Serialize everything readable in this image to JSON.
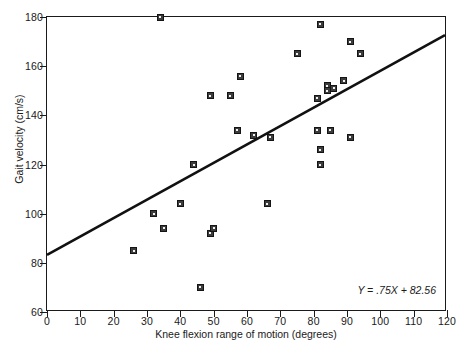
{
  "chart_data": {
    "type": "scatter",
    "title": "",
    "xlabel": "Knee flexion range of motion (degrees)",
    "ylabel": "Gait velocity (cm/s)",
    "xlim": [
      0,
      120
    ],
    "ylim": [
      60,
      180
    ],
    "xticks": [
      0,
      10,
      20,
      30,
      40,
      50,
      60,
      70,
      80,
      90,
      100,
      110,
      120
    ],
    "yticks": [
      60,
      80,
      100,
      120,
      140,
      160,
      180
    ],
    "grid": false,
    "legend": null,
    "annotations": [
      {
        "name": "regression-equation",
        "text": "Y = .75X + 82.56",
        "position": "bottom-right"
      }
    ],
    "fit_line": {
      "type": "linear",
      "slope": 0.75,
      "intercept": 82.56,
      "equation": "Y = .75X + 82.56",
      "x_start": 0,
      "y_start": 82.56,
      "x_end": 120,
      "y_end": 172.56
    },
    "points": [
      {
        "x": 26,
        "y": 85
      },
      {
        "x": 32,
        "y": 100
      },
      {
        "x": 34,
        "y": 180
      },
      {
        "x": 35,
        "y": 94
      },
      {
        "x": 40,
        "y": 104
      },
      {
        "x": 44,
        "y": 120
      },
      {
        "x": 46,
        "y": 70
      },
      {
        "x": 49,
        "y": 92
      },
      {
        "x": 49,
        "y": 148
      },
      {
        "x": 50,
        "y": 94
      },
      {
        "x": 55,
        "y": 148
      },
      {
        "x": 57,
        "y": 134
      },
      {
        "x": 58,
        "y": 156
      },
      {
        "x": 62,
        "y": 132
      },
      {
        "x": 66,
        "y": 104
      },
      {
        "x": 67,
        "y": 131
      },
      {
        "x": 75,
        "y": 165
      },
      {
        "x": 81,
        "y": 147
      },
      {
        "x": 81,
        "y": 134
      },
      {
        "x": 82,
        "y": 177
      },
      {
        "x": 82,
        "y": 126
      },
      {
        "x": 82,
        "y": 120
      },
      {
        "x": 84,
        "y": 152
      },
      {
        "x": 84,
        "y": 150
      },
      {
        "x": 85,
        "y": 134
      },
      {
        "x": 86,
        "y": 151
      },
      {
        "x": 89,
        "y": 154
      },
      {
        "x": 91,
        "y": 170
      },
      {
        "x": 91,
        "y": 131
      },
      {
        "x": 94,
        "y": 165
      }
    ]
  },
  "axis": {
    "x_title": "Knee flexion range of motion (degrees)",
    "y_title": "Gait velocity (cm/s)"
  }
}
